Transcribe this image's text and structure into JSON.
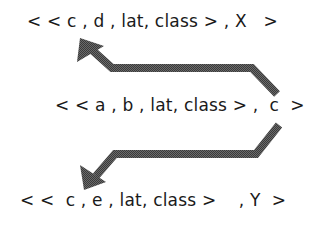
{
  "diagram": {
    "tuples": [
      {
        "id": "top",
        "text": "< < c , d , lat, class > , X   >"
      },
      {
        "id": "middle",
        "text": "< < a , b , lat, class > ,  c  >"
      },
      {
        "id": "bottom",
        "text": "< <  c , e , lat, class >    , Y  >"
      }
    ],
    "arrows": [
      {
        "from": "middle",
        "to": "top",
        "direction": "up-left"
      },
      {
        "from": "middle",
        "to": "bottom",
        "direction": "down-left"
      }
    ],
    "colors": {
      "arrow": "#555555",
      "text": "#1a1a1a",
      "background": "#ffffff"
    }
  }
}
